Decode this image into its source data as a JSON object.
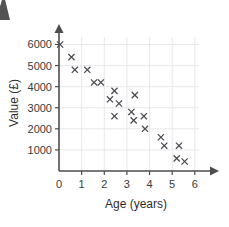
{
  "chart_data": {
    "type": "scatter",
    "title": "",
    "xlabel": "Age (years)",
    "ylabel": "Value (£)",
    "xlim": [
      0,
      6.45
    ],
    "ylim": [
      0,
      6450
    ],
    "xticks": [
      0,
      1,
      2,
      3,
      4,
      5,
      6
    ],
    "xtick_labels": [
      "0",
      "1",
      "2",
      "3",
      "4",
      "5",
      "6"
    ],
    "yticks": [
      1000,
      2000,
      3000,
      4000,
      5000,
      6000
    ],
    "ytick_labels": [
      "1000",
      "2000",
      "3000",
      "4000",
      "5000",
      "6000"
    ],
    "grid": true,
    "legend": null,
    "marker": "x",
    "marker_color": "#4a4a52",
    "axis_color": "#4d4d4d",
    "grid_color": "#e2e2e6",
    "points": [
      {
        "x": 0.05,
        "y": 6000
      },
      {
        "x": 0.55,
        "y": 5400
      },
      {
        "x": 0.7,
        "y": 4800
      },
      {
        "x": 1.25,
        "y": 4800
      },
      {
        "x": 1.55,
        "y": 4200
      },
      {
        "x": 1.85,
        "y": 4200
      },
      {
        "x": 2.45,
        "y": 3800
      },
      {
        "x": 2.25,
        "y": 3400
      },
      {
        "x": 2.65,
        "y": 3200
      },
      {
        "x": 3.35,
        "y": 3600
      },
      {
        "x": 2.45,
        "y": 2600
      },
      {
        "x": 3.2,
        "y": 2800
      },
      {
        "x": 3.3,
        "y": 2400
      },
      {
        "x": 3.75,
        "y": 2600
      },
      {
        "x": 3.8,
        "y": 2000
      },
      {
        "x": 4.5,
        "y": 1600
      },
      {
        "x": 4.65,
        "y": 1200
      },
      {
        "x": 5.3,
        "y": 1200
      },
      {
        "x": 5.2,
        "y": 600
      },
      {
        "x": 5.55,
        "y": 450
      }
    ]
  },
  "axes": {
    "x_title": "Age (years)",
    "y_title": "Value (£)"
  }
}
